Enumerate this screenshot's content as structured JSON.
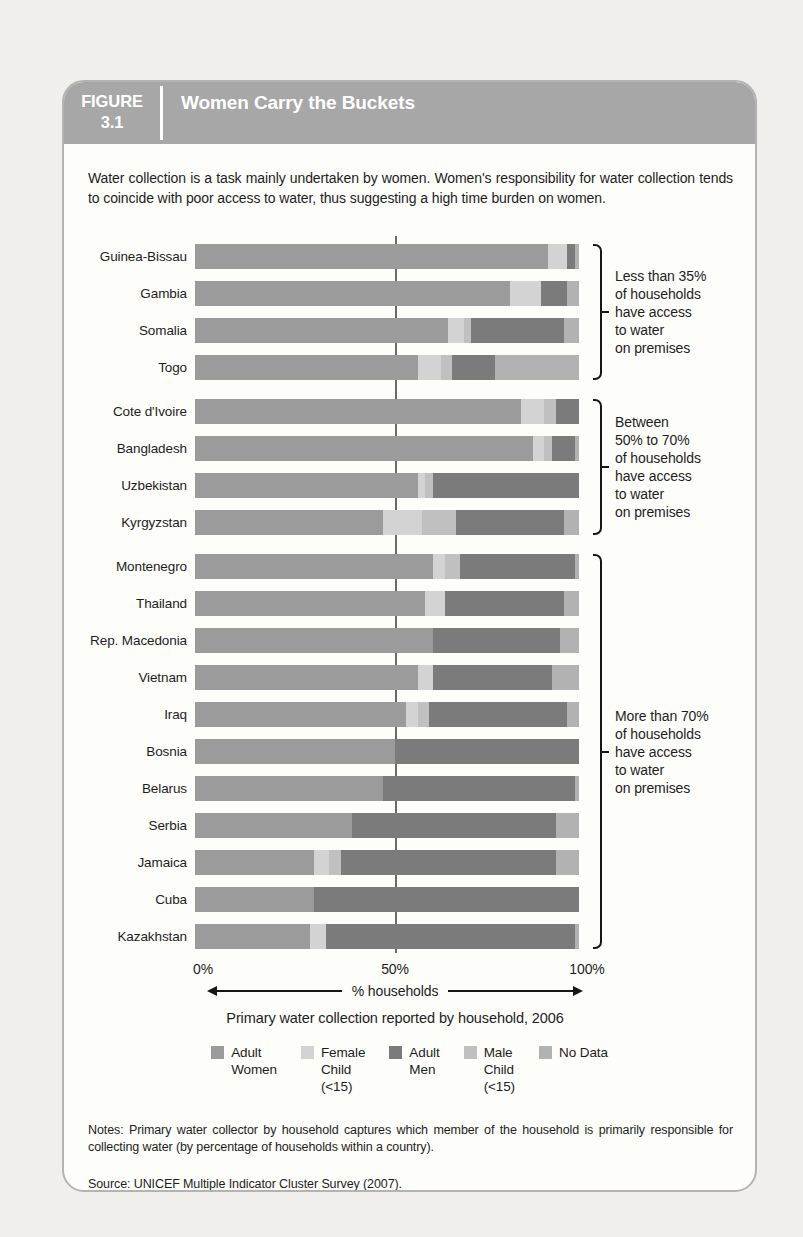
{
  "figure": {
    "label": "FIGURE",
    "number": "3.1",
    "title": "Women Carry the Buckets"
  },
  "description": "Water collection is a task mainly undertaken by women. Women's responsibility for water collection tends to coincide with poor access to water, thus suggesting a high time burden on women.",
  "axis": {
    "ticks": [
      "0%",
      "50%",
      "100%"
    ],
    "arrow_label": "% households"
  },
  "caption": "Primary water collection reported by household, 2006",
  "notes": "Notes: Primary water collector by household captures which member of the household is primarily responsible for collecting water (by percentage of households within a country).",
  "source": "Source: UNICEF Multiple Indicator Cluster Survey (2007).",
  "colors": {
    "adult_women": "#9b9b9b",
    "female_child": "#d3d3d3",
    "male_child": "#c0c0c0",
    "adult_men": "#7b7b7b",
    "no_data": "#b2b2b2",
    "header_band": "#a7a7a7",
    "panel_border": "#b3b3b3",
    "gridline": "#6a6a6a"
  },
  "legend": [
    {
      "key": "adult_women",
      "lines": [
        "Adult",
        "Women"
      ]
    },
    {
      "key": "female_child",
      "lines": [
        "Female",
        "Child",
        "(<15)"
      ]
    },
    {
      "key": "adult_men",
      "lines": [
        "Adult",
        "Men"
      ]
    },
    {
      "key": "male_child",
      "lines": [
        "Male",
        "Child",
        "(<15)"
      ]
    },
    {
      "key": "no_data",
      "lines": [
        "No Data"
      ]
    }
  ],
  "chart_data": {
    "type": "bar",
    "orientation": "horizontal",
    "stacked": true,
    "xlim": [
      0,
      100
    ],
    "xlabel": "% households",
    "gridlines": [
      50
    ],
    "stack_order": [
      "adult_women",
      "female_child",
      "male_child",
      "adult_men",
      "no_data"
    ],
    "series_names": {
      "adult_women": "Adult Women",
      "female_child": "Female Child (<15)",
      "male_child": "Male Child (<15)",
      "adult_men": "Adult Men",
      "no_data": "No Data"
    },
    "groups": [
      {
        "annotation_lines": [
          "Less than 35%",
          "of households",
          "have access",
          "to water",
          "on premises"
        ],
        "rows": [
          {
            "country": "Guinea-Bissau",
            "values": {
              "adult_women": 92,
              "female_child": 5,
              "male_child": 0,
              "adult_men": 2,
              "no_data": 1
            }
          },
          {
            "country": "Gambia",
            "values": {
              "adult_women": 82,
              "female_child": 8,
              "male_child": 0,
              "adult_men": 7,
              "no_data": 3
            }
          },
          {
            "country": "Somalia",
            "values": {
              "adult_women": 66,
              "female_child": 4,
              "male_child": 2,
              "adult_men": 24,
              "no_data": 4
            }
          },
          {
            "country": "Togo",
            "values": {
              "adult_women": 58,
              "female_child": 6,
              "male_child": 3,
              "adult_men": 11,
              "no_data": 22
            }
          }
        ]
      },
      {
        "annotation_lines": [
          "Between",
          "50% to 70%",
          "of households",
          "have access",
          "to water",
          "on premises"
        ],
        "rows": [
          {
            "country": "Cote d'Ivoire",
            "values": {
              "adult_women": 85,
              "female_child": 6,
              "male_child": 3,
              "adult_men": 6,
              "no_data": 0
            }
          },
          {
            "country": "Bangladesh",
            "values": {
              "adult_women": 88,
              "female_child": 3,
              "male_child": 2,
              "adult_men": 6,
              "no_data": 1
            }
          },
          {
            "country": "Uzbekistan",
            "values": {
              "adult_women": 58,
              "female_child": 2,
              "male_child": 2,
              "adult_men": 38,
              "no_data": 0
            }
          },
          {
            "country": "Kyrgyzstan",
            "values": {
              "adult_women": 49,
              "female_child": 10,
              "male_child": 9,
              "adult_men": 28,
              "no_data": 4
            }
          }
        ]
      },
      {
        "annotation_lines": [
          "More than 70%",
          "of households",
          "have access",
          "to water",
          "on premises"
        ],
        "rows": [
          {
            "country": "Montenegro",
            "values": {
              "adult_women": 62,
              "female_child": 3,
              "male_child": 4,
              "adult_men": 30,
              "no_data": 1
            }
          },
          {
            "country": "Thailand",
            "values": {
              "adult_women": 60,
              "female_child": 5,
              "male_child": 0,
              "adult_men": 31,
              "no_data": 4
            }
          },
          {
            "country": "Rep. Macedonia",
            "values": {
              "adult_women": 62,
              "female_child": 0,
              "male_child": 0,
              "adult_men": 33,
              "no_data": 5
            }
          },
          {
            "country": "Vietnam",
            "values": {
              "adult_women": 58,
              "female_child": 4,
              "male_child": 0,
              "adult_men": 31,
              "no_data": 7
            }
          },
          {
            "country": "Iraq",
            "values": {
              "adult_women": 55,
              "female_child": 3,
              "male_child": 3,
              "adult_men": 36,
              "no_data": 3
            }
          },
          {
            "country": "Bosnia",
            "values": {
              "adult_women": 52,
              "female_child": 0,
              "male_child": 0,
              "adult_men": 48,
              "no_data": 0
            }
          },
          {
            "country": "Belarus",
            "values": {
              "adult_women": 49,
              "female_child": 0,
              "male_child": 0,
              "adult_men": 50,
              "no_data": 1
            }
          },
          {
            "country": "Serbia",
            "values": {
              "adult_women": 41,
              "female_child": 0,
              "male_child": 0,
              "adult_men": 53,
              "no_data": 6
            }
          },
          {
            "country": "Jamaica",
            "values": {
              "adult_women": 31,
              "female_child": 4,
              "male_child": 3,
              "adult_men": 56,
              "no_data": 6
            }
          },
          {
            "country": "Cuba",
            "values": {
              "adult_women": 31,
              "female_child": 0,
              "male_child": 0,
              "adult_men": 69,
              "no_data": 0
            }
          },
          {
            "country": "Kazakhstan",
            "values": {
              "adult_women": 30,
              "female_child": 4,
              "male_child": 0,
              "adult_men": 65,
              "no_data": 1
            }
          }
        ]
      }
    ]
  }
}
